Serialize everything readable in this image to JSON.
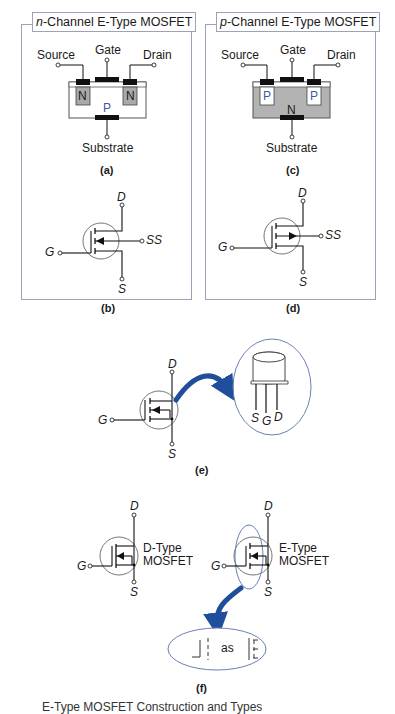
{
  "figure": {
    "panels": {
      "n_channel": {
        "title_prefix": "n",
        "title_rest": "-Channel E-Type MOSFET",
        "labels": {
          "source": "Source",
          "gate": "Gate",
          "drain": "Drain",
          "substrate": "Substrate",
          "left_region": "N",
          "right_region": "N",
          "body_region": "P"
        },
        "sub_a": "(a)",
        "symbol": {
          "d": "D",
          "g": "G",
          "s": "S",
          "ss": "SS"
        },
        "sub_b": "(b)"
      },
      "p_channel": {
        "title_prefix": "p",
        "title_rest": "-Channel E-Type MOSFET",
        "labels": {
          "source": "Source",
          "gate": "Gate",
          "drain": "Drain",
          "substrate": "Substrate",
          "left_region": "P",
          "right_region": "P",
          "body_region": "N"
        },
        "sub_c": "(c)",
        "symbol": {
          "d": "D",
          "g": "G",
          "s": "S",
          "ss": "SS"
        },
        "sub_d": "(d)"
      }
    },
    "e": {
      "symbol": {
        "d": "D",
        "g": "G",
        "s": "S"
      },
      "package_pins": {
        "s": "S",
        "g": "G",
        "d": "D"
      },
      "sub": "(e)"
    },
    "f": {
      "d_type": {
        "d": "D",
        "g": "G",
        "s": "S",
        "line1": "D-Type",
        "line2": "MOSFET"
      },
      "e_type": {
        "d": "D",
        "g": "G",
        "s": "S",
        "line1": "E-Type",
        "line2": "MOSFET"
      },
      "bubble_text": "as",
      "sub": "(f)"
    },
    "colors": {
      "frame": "#9aa3b8",
      "arrow_blue": "#1f4e9a",
      "oval_blue": "#6a7fb5",
      "n_region_gray": "#a9a9a9",
      "p_body_gray": "#b3b3b3",
      "p_letter_blue": "#3a5aa8"
    },
    "caption_partial": "E-Type MOSFET Construction and Types"
  }
}
